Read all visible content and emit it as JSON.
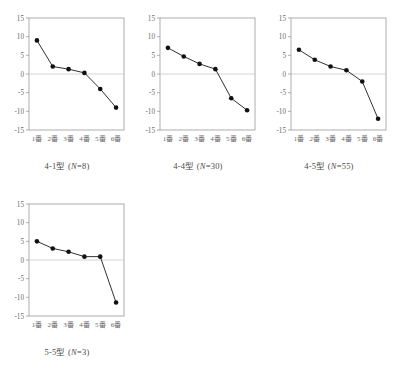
{
  "figure": {
    "panel_count": 4,
    "x_categories": [
      "1番",
      "2番",
      "3番",
      "4番",
      "5番",
      "6番"
    ],
    "y_ticks": [
      "15",
      "10",
      "5",
      "0",
      "-5",
      "-10",
      "-15"
    ],
    "y_min": -15,
    "y_max": 15,
    "zero_line_color": "#c9c9c9",
    "frame_color": "#9a9a9a",
    "line_color": "#1a1a1a",
    "marker_color": "#111111"
  },
  "chart_data": [
    {
      "type": "line",
      "title": "4-1型 (N=8)",
      "title_prefix": "4-1型 (",
      "title_italic": "N",
      "title_suffix": "=8)",
      "n": 8,
      "categories": [
        "1番",
        "2番",
        "3番",
        "4番",
        "5番",
        "6番"
      ],
      "values": [
        9.0,
        2.0,
        1.3,
        0.3,
        -4.0,
        -9.0
      ],
      "xlabel": "",
      "ylabel": "",
      "ylim": [
        -15,
        15
      ],
      "yticks": [
        15,
        10,
        5,
        0,
        -5,
        -10,
        -15
      ],
      "grid": false,
      "legend": "none"
    },
    {
      "type": "line",
      "title": "4-4型 (N=30)",
      "title_prefix": "4-4型 (",
      "title_italic": "N",
      "title_suffix": "=30)",
      "n": 30,
      "categories": [
        "1番",
        "2番",
        "3番",
        "4番",
        "5番",
        "6番"
      ],
      "values": [
        7.0,
        4.7,
        2.7,
        1.3,
        -6.5,
        -9.7
      ],
      "xlabel": "",
      "ylabel": "",
      "ylim": [
        -15,
        15
      ],
      "yticks": [
        15,
        10,
        5,
        0,
        -5,
        -10,
        -15
      ],
      "grid": false,
      "legend": "none"
    },
    {
      "type": "line",
      "title": "4-5型 (N=55)",
      "title_prefix": "4-5型 (",
      "title_italic": "N",
      "title_suffix": "=55)",
      "n": 55,
      "categories": [
        "1番",
        "2番",
        "3番",
        "4番",
        "5番",
        "6番"
      ],
      "values": [
        6.5,
        3.8,
        2.0,
        1.0,
        -2.0,
        -12.0
      ],
      "xlabel": "",
      "ylabel": "",
      "ylim": [
        -15,
        15
      ],
      "yticks": [
        15,
        10,
        5,
        0,
        -5,
        -10,
        -15
      ],
      "grid": false,
      "legend": "none"
    },
    {
      "type": "line",
      "title": "5-5型 (N=3)",
      "title_prefix": "5-5型 (",
      "title_italic": "N",
      "title_suffix": "=3)",
      "n": 3,
      "categories": [
        "1番",
        "2番",
        "3番",
        "4番",
        "5番",
        "6番"
      ],
      "values": [
        5.0,
        3.1,
        2.2,
        0.9,
        0.9,
        -11.4
      ],
      "xlabel": "",
      "ylabel": "",
      "ylim": [
        -15,
        15
      ],
      "yticks": [
        15,
        10,
        5,
        0,
        -5,
        -10,
        -15
      ],
      "grid": false,
      "legend": "none"
    }
  ]
}
